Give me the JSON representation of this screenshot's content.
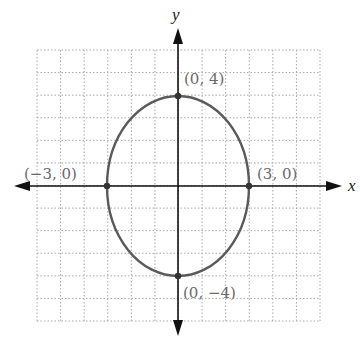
{
  "chart_data": {
    "type": "scatter",
    "title": "",
    "xlabel": "x",
    "ylabel": "y",
    "xlim": [
      -6,
      6
    ],
    "ylim": [
      -6,
      6
    ],
    "grid": true,
    "curve": {
      "shape": "ellipse",
      "center": [
        0,
        0
      ],
      "a_x": 3,
      "b_y": 4,
      "equation": "x^2/9 + y^2/16 = 1"
    },
    "points": [
      {
        "x": 0,
        "y": 4,
        "label": "(0, 4)"
      },
      {
        "x": 3,
        "y": 0,
        "label": "(3, 0)"
      },
      {
        "x": -3,
        "y": 0,
        "label": "(−3, 0)"
      },
      {
        "x": 0,
        "y": -4,
        "label": "(0, −4)"
      }
    ]
  },
  "axes": {
    "x_label": "x",
    "y_label": "y"
  },
  "labels": {
    "top": "(0, 4)",
    "right": "(3, 0)",
    "left": "(−3, 0)",
    "bottom": "(0, −4)"
  },
  "colors": {
    "axis": "#111111",
    "curve": "#5a5a5a",
    "grid": "#a8a8a8",
    "label": "#6a6a6a"
  }
}
